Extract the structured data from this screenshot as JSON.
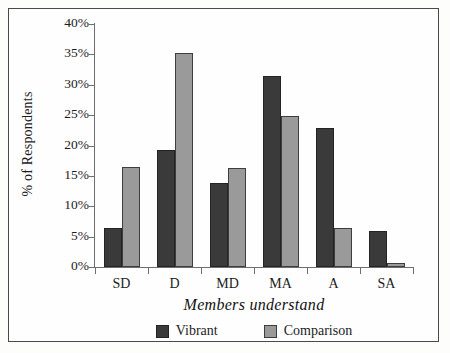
{
  "chart_data": {
    "type": "bar",
    "title": "",
    "xlabel": "Members understand",
    "ylabel": "% of Respondents",
    "categories": [
      "SD",
      "D",
      "MD",
      "MA",
      "A",
      "SA"
    ],
    "series": [
      {
        "name": "Vibrant",
        "color": "#3a3a3a",
        "values": [
          6.5,
          19.3,
          13.8,
          31.4,
          22.9,
          6.0
        ]
      },
      {
        "name": "Comparison",
        "color": "#9a9a9a",
        "values": [
          16.4,
          35.3,
          16.3,
          24.9,
          6.4,
          0.7
        ]
      }
    ],
    "ylim": [
      0,
      40
    ],
    "yticks": [
      0,
      5,
      10,
      15,
      20,
      25,
      30,
      35,
      40
    ],
    "ytick_labels": [
      "0%",
      "5%",
      "10%",
      "15%",
      "20%",
      "25%",
      "30%",
      "35%",
      "40%"
    ],
    "grid": false,
    "legend_position": "bottom"
  }
}
